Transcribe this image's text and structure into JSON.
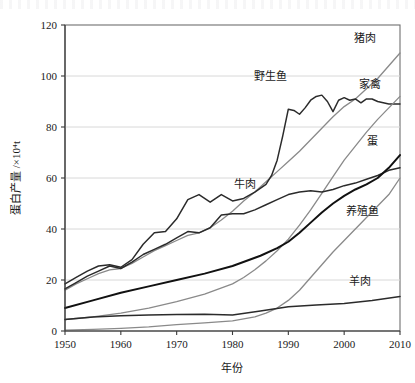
{
  "chart_data": {
    "type": "line",
    "title": "",
    "xlabel": "年份",
    "ylabel": "蛋白产量 /×10⁴t",
    "xlim": [
      1950,
      2010
    ],
    "ylim": [
      0,
      120
    ],
    "xticks": [
      "1950",
      "1960",
      "1970",
      "1980",
      "1990",
      "2000",
      "2010"
    ],
    "yticks": [
      "0",
      "20",
      "40",
      "60",
      "80",
      "100",
      "120"
    ],
    "grid": "horizontal",
    "legend_position": "inline-labels",
    "series": [
      {
        "name": "猪肉",
        "label": "猪肉",
        "color": "#8a8a8a",
        "width": 1.3,
        "x": [
          1950,
          1952,
          1954,
          1956,
          1958,
          1960,
          1962,
          1964,
          1966,
          1968,
          1970,
          1972,
          1974,
          1976,
          1978,
          1980,
          1982,
          1984,
          1986,
          1988,
          1990,
          1992,
          1994,
          1996,
          1998,
          2000,
          2002,
          2004,
          2006,
          2008,
          2010
        ],
        "values": [
          16.0,
          18.5,
          20.5,
          22.5,
          24.0,
          24.5,
          26.5,
          29.0,
          31.5,
          33.5,
          35.5,
          37.5,
          38.5,
          40.5,
          43.5,
          47.0,
          51.0,
          54.5,
          58.5,
          62.5,
          66.5,
          70.5,
          75.0,
          79.5,
          84.0,
          88.0,
          91.0,
          95.0,
          99.0,
          104.0,
          109.0
        ]
      },
      {
        "name": "野生鱼",
        "label": "野生鱼",
        "color": "#2b2b2b",
        "width": 1.5,
        "x": [
          1950,
          1952,
          1954,
          1956,
          1958,
          1960,
          1962,
          1964,
          1966,
          1968,
          1970,
          1972,
          1974,
          1976,
          1978,
          1980,
          1982,
          1984,
          1986,
          1987,
          1988,
          1989,
          1990,
          1991,
          1992,
          1993,
          1994,
          1995,
          1996,
          1997,
          1998,
          1999,
          2000,
          2001,
          2002,
          2003,
          2004,
          2005,
          2006,
          2007,
          2008,
          2009,
          2010
        ],
        "values": [
          18.5,
          21.0,
          23.5,
          25.5,
          26.0,
          25.0,
          28.0,
          34.0,
          38.5,
          39.0,
          44.0,
          51.5,
          53.5,
          50.5,
          53.5,
          51.0,
          52.0,
          54.5,
          57.5,
          61.0,
          67.0,
          76.5,
          87.0,
          86.5,
          85.0,
          87.5,
          90.5,
          92.0,
          92.5,
          90.0,
          86.0,
          90.5,
          91.5,
          90.5,
          91.0,
          89.5,
          91.0,
          91.0,
          90.0,
          89.5,
          89.0,
          89.0,
          89.0
        ]
      },
      {
        "name": "家禽",
        "label": "家禽",
        "color": "#8a8a8a",
        "width": 1.3,
        "x": [
          1950,
          1955,
          1960,
          1965,
          1970,
          1975,
          1980,
          1982,
          1984,
          1986,
          1988,
          1990,
          1992,
          1994,
          1996,
          1998,
          2000,
          2002,
          2004,
          2006,
          2008,
          2010
        ],
        "values": [
          4.5,
          5.5,
          7.0,
          9.0,
          11.5,
          14.5,
          18.5,
          21.0,
          24.0,
          27.5,
          31.5,
          36.0,
          41.5,
          47.5,
          54.0,
          60.5,
          67.0,
          72.5,
          78.0,
          83.0,
          87.5,
          92.0
        ]
      },
      {
        "name": "牛肉",
        "label": "牛肉",
        "color": "#2b2b2b",
        "width": 1.5,
        "x": [
          1950,
          1952,
          1954,
          1956,
          1958,
          1960,
          1962,
          1964,
          1966,
          1968,
          1970,
          1972,
          1974,
          1976,
          1978,
          1980,
          1982,
          1984,
          1986,
          1988,
          1990,
          1992,
          1994,
          1996,
          1998,
          2000,
          2002,
          2004,
          2006,
          2008,
          2010
        ],
        "values": [
          16.5,
          19.0,
          21.5,
          23.5,
          25.5,
          24.5,
          27.0,
          30.0,
          32.0,
          34.0,
          36.5,
          39.0,
          38.5,
          40.5,
          45.5,
          46.0,
          46.0,
          47.5,
          49.5,
          51.5,
          53.5,
          54.5,
          55.0,
          54.5,
          55.5,
          57.0,
          58.0,
          59.5,
          61.0,
          63.0,
          64.0
        ]
      },
      {
        "name": "蛋",
        "label": "蛋",
        "color": "#111111",
        "width": 2.0,
        "x": [
          1950,
          1955,
          1960,
          1965,
          1970,
          1975,
          1980,
          1985,
          1988,
          1990,
          1992,
          1994,
          1996,
          1998,
          2000,
          2002,
          2004,
          2006,
          2008,
          2010
        ],
        "values": [
          9.0,
          12.0,
          15.0,
          17.5,
          20.0,
          22.5,
          25.5,
          29.5,
          32.5,
          35.0,
          38.5,
          42.5,
          46.5,
          50.0,
          53.0,
          55.5,
          57.5,
          60.0,
          64.0,
          69.0
        ]
      },
      {
        "name": "养殖鱼",
        "label": "养殖鱼",
        "color": "#8a8a8a",
        "width": 1.3,
        "x": [
          1950,
          1955,
          1960,
          1965,
          1970,
          1975,
          1980,
          1984,
          1986,
          1988,
          1990,
          1992,
          1994,
          1996,
          1998,
          2000,
          2002,
          2004,
          2006,
          2008,
          2010
        ],
        "values": [
          0.3,
          0.6,
          1.0,
          1.6,
          2.5,
          3.2,
          4.0,
          5.5,
          7.0,
          9.0,
          12.0,
          16.0,
          21.0,
          26.0,
          31.0,
          35.5,
          40.0,
          44.5,
          49.0,
          53.5,
          60.0
        ]
      },
      {
        "name": "羊肉",
        "label": "羊肉",
        "color": "#2b2b2b",
        "width": 1.5,
        "x": [
          1950,
          1955,
          1960,
          1965,
          1970,
          1975,
          1980,
          1985,
          1990,
          1995,
          2000,
          2005,
          2010
        ],
        "values": [
          4.5,
          5.5,
          6.0,
          6.3,
          6.5,
          6.6,
          6.3,
          7.8,
          9.5,
          10.2,
          10.8,
          12.0,
          13.5
        ]
      }
    ],
    "series_labels": [
      {
        "name": "猪肉",
        "x_px": 365,
        "y_px": 42
      },
      {
        "name": "野生鱼",
        "x_px": 270,
        "y_px": 80
      },
      {
        "name": "家禽",
        "x_px": 370,
        "y_px": 88
      },
      {
        "name": "蛋",
        "x_px": 372,
        "y_px": 145
      },
      {
        "name": "牛肉",
        "x_px": 245,
        "y_px": 188
      },
      {
        "name": "养殖鱼",
        "x_px": 362,
        "y_px": 215
      },
      {
        "name": "羊肉",
        "x_px": 360,
        "y_px": 285
      }
    ]
  }
}
